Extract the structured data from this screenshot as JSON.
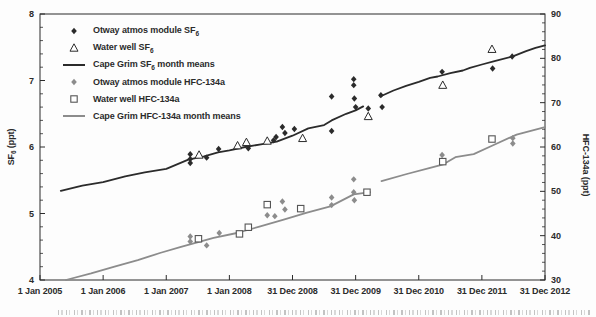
{
  "figure": {
    "background": "#fdfdfd",
    "frame_color": "#2b2b2b",
    "text_color": "#2b2b2b",
    "black_series_color": "#2b2b2b",
    "gray_series_color": "#8c8c8c",
    "square_outline_color": "#555555"
  },
  "chart_data": {
    "type": "line+scatter",
    "legend_position": "top-left",
    "grid": false,
    "x_axis": {
      "tick_labels": [
        "1 Jan 2005",
        "1 Jan 2006",
        "1 Jan 2007",
        "1 Jan 2008",
        "31 Dec 2008",
        "31 Dec 2009",
        "31 Dec 2010",
        "31 Dec 2011",
        "31 Dec 2012"
      ],
      "tick_years": [
        2005,
        2006,
        2007,
        2008,
        2009,
        2010,
        2011,
        2012,
        2013
      ],
      "range": [
        2005,
        2013
      ]
    },
    "y_left": {
      "label_pre": "SF",
      "label_sub": "6",
      "label_post": " (ppt)",
      "range": [
        4,
        8
      ],
      "ticks": [
        4,
        5,
        6,
        7,
        8
      ],
      "minor_step": 0.2
    },
    "y_right": {
      "label_pre": "HFC-134a (ppt)",
      "label_sub": "",
      "label_post": "",
      "range": [
        30,
        90
      ],
      "ticks": [
        30,
        40,
        50,
        60,
        70,
        80,
        90
      ],
      "minor_step": 2
    },
    "series": [
      {
        "id": "otway-atmos-module-sf6",
        "label_pre": "Otway atmos module SF",
        "label_sub": "6",
        "label_post": "",
        "mode": "scatter",
        "marker": "diamond-filled",
        "color": "#2b2b2b",
        "axis": "left",
        "points": [
          [
            2007.38,
            5.76
          ],
          [
            2007.38,
            5.82
          ],
          [
            2007.38,
            5.89
          ],
          [
            2007.64,
            5.84
          ],
          [
            2007.83,
            5.97
          ],
          [
            2008.3,
            5.98
          ],
          [
            2008.7,
            6.1
          ],
          [
            2008.74,
            6.15
          ],
          [
            2008.84,
            6.3
          ],
          [
            2008.88,
            6.21
          ],
          [
            2009.03,
            6.27
          ],
          [
            2009.62,
            6.76
          ],
          [
            2009.62,
            6.24
          ],
          [
            2009.97,
            7.02
          ],
          [
            2009.97,
            6.93
          ],
          [
            2009.98,
            6.73
          ],
          [
            2010.0,
            6.6
          ],
          [
            2010.2,
            6.58
          ],
          [
            2010.4,
            6.78
          ],
          [
            2010.42,
            6.6
          ],
          [
            2011.37,
            7.13
          ],
          [
            2012.17,
            7.18
          ],
          [
            2012.48,
            7.36
          ]
        ]
      },
      {
        "id": "water-well-sf6",
        "label_pre": "Water well SF",
        "label_sub": "6",
        "label_post": "",
        "mode": "scatter",
        "marker": "triangle-open",
        "color": "#2b2b2b",
        "axis": "left",
        "points": [
          [
            2007.52,
            5.88
          ],
          [
            2008.13,
            6.02
          ],
          [
            2008.27,
            6.07
          ],
          [
            2008.6,
            6.09
          ],
          [
            2009.16,
            6.13
          ],
          [
            2010.2,
            6.46
          ],
          [
            2011.38,
            6.93
          ],
          [
            2012.16,
            7.47
          ]
        ]
      },
      {
        "id": "cape-grim-sf6-month-means",
        "label_pre": "Cape Grim SF",
        "label_sub": "6",
        "label_post": " month means",
        "mode": "line",
        "marker": "line",
        "color": "#2b2b2b",
        "axis": "left",
        "segments": [
          [
            [
              2005.33,
              5.34
            ],
            [
              2005.67,
              5.42
            ],
            [
              2006.0,
              5.47
            ],
            [
              2006.35,
              5.56
            ],
            [
              2006.66,
              5.62
            ],
            [
              2007.0,
              5.67
            ],
            [
              2007.35,
              5.81
            ],
            [
              2007.6,
              5.86
            ],
            [
              2007.82,
              5.92
            ],
            [
              2008.0,
              5.95
            ],
            [
              2008.25,
              6.0
            ],
            [
              2008.5,
              6.04
            ],
            [
              2008.75,
              6.08
            ],
            [
              2009.0,
              6.17
            ],
            [
              2009.25,
              6.28
            ],
            [
              2009.5,
              6.33
            ],
            [
              2009.62,
              6.4
            ],
            [
              2009.85,
              6.5
            ],
            [
              2010.0,
              6.55
            ],
            [
              2010.12,
              6.61
            ]
          ],
          [
            [
              2010.39,
              6.76
            ],
            [
              2010.6,
              6.85
            ],
            [
              2010.8,
              6.92
            ],
            [
              2011.0,
              6.98
            ],
            [
              2011.18,
              7.04
            ],
            [
              2011.3,
              7.06
            ],
            [
              2011.5,
              7.11
            ],
            [
              2011.7,
              7.15
            ],
            [
              2011.81,
              7.19
            ],
            [
              2012.0,
              7.24
            ],
            [
              2012.2,
              7.29
            ],
            [
              2012.48,
              7.36
            ],
            [
              2012.7,
              7.44
            ],
            [
              2012.85,
              7.49
            ],
            [
              2013.0,
              7.53
            ]
          ]
        ]
      },
      {
        "id": "otway-atmos-module-hfc-134a",
        "label_pre": "Otway atmos module HFC-134a",
        "label_sub": "",
        "label_post": "",
        "mode": "scatter",
        "marker": "diamond-filled",
        "color": "#8c8c8c",
        "axis": "right",
        "points": [
          [
            2007.38,
            38.7
          ],
          [
            2007.38,
            39.8
          ],
          [
            2007.64,
            37.8
          ],
          [
            2007.84,
            40.6
          ],
          [
            2008.6,
            44.6
          ],
          [
            2008.72,
            44.4
          ],
          [
            2008.84,
            47.7
          ],
          [
            2008.88,
            45.9
          ],
          [
            2009.62,
            48.6
          ],
          [
            2009.62,
            46.9
          ],
          [
            2009.97,
            52.7
          ],
          [
            2009.97,
            49.8
          ],
          [
            2009.98,
            48.0
          ],
          [
            2011.37,
            58.2
          ],
          [
            2012.49,
            62.0
          ],
          [
            2012.49,
            60.8
          ]
        ]
      },
      {
        "id": "water-well-hfc-134a",
        "label_pre": "Water well HFC-134a",
        "label_sub": "",
        "label_post": "",
        "mode": "scatter",
        "marker": "square-open",
        "color": "#555555",
        "axis": "right",
        "points": [
          [
            2007.51,
            39.3
          ],
          [
            2008.16,
            40.4
          ],
          [
            2008.3,
            41.9
          ],
          [
            2008.6,
            47.0
          ],
          [
            2009.13,
            46.1
          ],
          [
            2010.18,
            49.8
          ],
          [
            2011.38,
            56.7
          ],
          [
            2012.16,
            61.8
          ]
        ]
      },
      {
        "id": "cape-grim-hfc-134a-month-means",
        "label_pre": "Cape Grim HFC-134a month means",
        "label_sub": "",
        "label_post": "",
        "mode": "line",
        "marker": "line",
        "color": "#8c8c8c",
        "axis": "right",
        "segments": [
          [
            [
              2005.41,
              30.0
            ],
            [
              2005.81,
              31.5
            ],
            [
              2006.18,
              33.0
            ],
            [
              2006.55,
              34.5
            ],
            [
              2006.9,
              36.1
            ],
            [
              2007.22,
              37.4
            ],
            [
              2007.75,
              39.5
            ],
            [
              2008.12,
              40.6
            ],
            [
              2008.49,
              42.1
            ],
            [
              2008.86,
              43.6
            ],
            [
              2009.23,
              45.2
            ],
            [
              2009.6,
              46.6
            ],
            [
              2009.97,
              49.3
            ],
            [
              2010.23,
              49.8
            ]
          ],
          [
            [
              2010.41,
              52.3
            ],
            [
              2010.81,
              53.9
            ],
            [
              2011.18,
              55.3
            ],
            [
              2011.39,
              56.1
            ],
            [
              2011.58,
              57.7
            ],
            [
              2011.87,
              58.4
            ],
            [
              2012.16,
              60.3
            ],
            [
              2012.55,
              62.8
            ],
            [
              2013.0,
              64.5
            ]
          ]
        ]
      }
    ]
  }
}
